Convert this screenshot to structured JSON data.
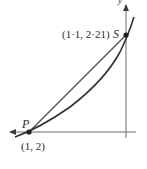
{
  "diagram": {
    "labels": {
      "point_s_name": "S",
      "point_s_coords": "(1·1, 2·21)",
      "point_p_name": "P",
      "point_p_coords": "(1, 2)",
      "y_axis_label": "y"
    },
    "points": [
      {
        "name": "P",
        "x": 1,
        "y": 2
      },
      {
        "name": "S",
        "x": 1.1,
        "y": 2.21
      }
    ],
    "elements": [
      "horizontal axis with left arrow",
      "vertical axis with up arrow",
      "curve",
      "chord PS"
    ],
    "colors": {
      "ink": "#3a3a3a",
      "axis": "#7a7a7a"
    }
  }
}
